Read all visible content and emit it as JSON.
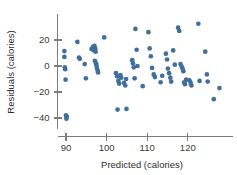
{
  "chart_data": {
    "type": "scatter",
    "title": "",
    "xlabel": "Predicted (calories)",
    "ylabel": "Residuals (calories)",
    "xticks": [
      90,
      100,
      110,
      120
    ],
    "yticks": [
      20,
      0,
      -20,
      -40
    ],
    "xtick_labels": [
      "90",
      "100",
      "110",
      "120"
    ],
    "ytick_labels": [
      "20",
      "0",
      "−20",
      "−40"
    ],
    "xlim": [
      87.5,
      129.5
    ],
    "ylim": [
      -44,
      34
    ],
    "grid": false,
    "legend": null,
    "marker_color": "#3f6f9a",
    "axis_color": "#7c7c7c",
    "points": [
      [
        89.6,
        11.5
      ],
      [
        89.6,
        7.0
      ],
      [
        89.7,
        -1.0
      ],
      [
        89.8,
        -2.5
      ],
      [
        89.9,
        -10.5
      ],
      [
        90.0,
        -38.0
      ],
      [
        90.1,
        -40.5
      ],
      [
        90.2,
        -39.0
      ],
      [
        92.8,
        18.5
      ],
      [
        93.2,
        6.5
      ],
      [
        93.4,
        5.5
      ],
      [
        94.6,
        1.5
      ],
      [
        94.9,
        -9.5
      ],
      [
        96.3,
        13.0
      ],
      [
        96.6,
        14.5
      ],
      [
        96.9,
        12.0
      ],
      [
        97.0,
        15.5
      ],
      [
        97.2,
        13.5
      ],
      [
        97.3,
        11.0
      ],
      [
        97.1,
        4.0
      ],
      [
        97.4,
        2.0
      ],
      [
        97.5,
        0.5
      ],
      [
        97.6,
        -1.5
      ],
      [
        97.8,
        -3.5
      ],
      [
        97.9,
        -5.0
      ],
      [
        99.4,
        22.0
      ],
      [
        102.3,
        -5.5
      ],
      [
        102.6,
        -8.0
      ],
      [
        102.9,
        -11.5
      ],
      [
        103.1,
        -13.5
      ],
      [
        103.4,
        -7.0
      ],
      [
        103.6,
        -9.0
      ],
      [
        102.7,
        -33.5
      ],
      [
        104.9,
        -33.0
      ],
      [
        104.3,
        -13.0
      ],
      [
        104.6,
        -15.0
      ],
      [
        104.8,
        -10.0
      ],
      [
        106.3,
        4.5
      ],
      [
        106.5,
        2.0
      ],
      [
        106.7,
        -1.0
      ],
      [
        106.9,
        -9.5
      ],
      [
        107.1,
        28.5
      ],
      [
        107.4,
        12.5
      ],
      [
        107.6,
        0.0
      ],
      [
        108.9,
        -15.5
      ],
      [
        110.3,
        26.0
      ],
      [
        110.6,
        13.5
      ],
      [
        110.9,
        7.5
      ],
      [
        111.2,
        -1.5
      ],
      [
        111.6,
        -6.5
      ],
      [
        111.9,
        -8.5
      ],
      [
        113.3,
        -12.5
      ],
      [
        113.7,
        -7.5
      ],
      [
        114.6,
        9.5
      ],
      [
        114.9,
        5.0
      ],
      [
        115.1,
        -2.0
      ],
      [
        115.4,
        -5.5
      ],
      [
        115.7,
        -9.0
      ],
      [
        115.9,
        -12.0
      ],
      [
        116.4,
        12.0
      ],
      [
        116.8,
        1.0
      ],
      [
        117.6,
        29.5
      ],
      [
        117.9,
        27.0
      ],
      [
        118.2,
        1.5
      ],
      [
        118.5,
        -0.5
      ],
      [
        118.7,
        -2.0
      ],
      [
        118.9,
        -4.0
      ],
      [
        119.1,
        -12.5
      ],
      [
        119.3,
        -14.0
      ],
      [
        119.6,
        -10.5
      ],
      [
        120.4,
        -11.0
      ],
      [
        120.7,
        -13.0
      ],
      [
        120.9,
        -15.0
      ],
      [
        122.6,
        32.5
      ],
      [
        122.9,
        -11.5
      ],
      [
        124.3,
        11.0
      ],
      [
        124.7,
        -6.5
      ],
      [
        124.9,
        -12.0
      ],
      [
        126.4,
        -25.5
      ],
      [
        127.8,
        -17.0
      ]
    ]
  }
}
